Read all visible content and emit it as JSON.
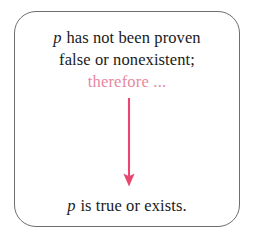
{
  "diagram": {
    "box": {
      "border_color": "#6e6e6e",
      "background_color": "#ffffff",
      "corner_radius": "22px"
    },
    "premise": {
      "line1_var": "p",
      "line1_text": " has not been proven",
      "line2_text": "false or nonexistent;"
    },
    "inference": {
      "label": "therefore ...",
      "color": "#e7879f"
    },
    "arrow": {
      "name": "downward-arrow",
      "color": "#e8456f",
      "direction": "down"
    },
    "conclusion": {
      "var": "p",
      "text": " is true or exists."
    },
    "colors": {
      "text": "#1a1a1a",
      "accent_pink": "#e7879f",
      "accent_crimson": "#e8456f",
      "border_gray": "#6e6e6e",
      "background": "#ffffff"
    }
  }
}
